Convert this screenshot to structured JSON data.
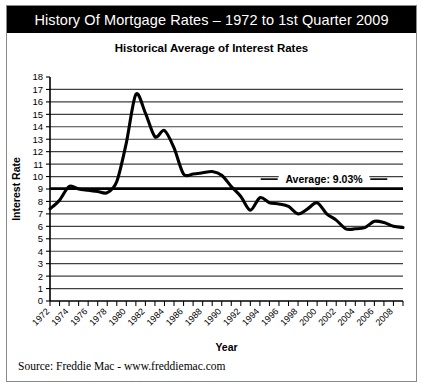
{
  "banner": {
    "title": "History Of Mortgage Rates – 1972 to 1st Quarter 2009"
  },
  "chart_title": "Historical Average of Interest Rates",
  "footer": {
    "source": "Source:  Freddie Mac - www.freddiemac.com"
  },
  "colors": {
    "banner_bg": "#000000",
    "banner_text": "#ffffff",
    "line": "#000000",
    "grid": "#404040",
    "frame": "#8a8a8a",
    "background": "#ffffff"
  },
  "chart_data": {
    "type": "line",
    "title": "Historical Average of Interest Rates",
    "xlabel": "Year",
    "ylabel": "Interest Rate",
    "xlim": [
      1972,
      2009
    ],
    "ylim": [
      0,
      18
    ],
    "ytick_step": 1,
    "xtick_step": 1,
    "xtick_label_step": 2,
    "grid": true,
    "legend": "none",
    "ytick_labels": [
      "0",
      "1",
      "2",
      "3",
      "4",
      "5",
      "6",
      "7",
      "8",
      "9",
      "10",
      "11",
      "12",
      "13",
      "14",
      "15",
      "16",
      "17",
      "18"
    ],
    "xtick_labels": [
      "1972",
      "1974",
      "1976",
      "1978",
      "1980",
      "1982",
      "1984",
      "1986",
      "1988",
      "1990",
      "1992",
      "1994",
      "1996",
      "1998",
      "2000",
      "2002",
      "2004",
      "2006",
      "2008"
    ],
    "series": [
      {
        "name": "Average Interest Rate",
        "x": [
          1972,
          1973,
          1974,
          1975,
          1976,
          1977,
          1978,
          1979,
          1980,
          1981,
          1982,
          1983,
          1984,
          1985,
          1986,
          1987,
          1988,
          1989,
          1990,
          1991,
          1992,
          1993,
          1994,
          1995,
          1996,
          1997,
          1998,
          1999,
          2000,
          2001,
          2002,
          2003,
          2004,
          2005,
          2006,
          2007,
          2008,
          2009
        ],
        "values": [
          7.4,
          8.1,
          9.2,
          9.0,
          8.9,
          8.8,
          8.7,
          9.6,
          12.7,
          16.6,
          15.1,
          13.2,
          13.7,
          12.3,
          10.2,
          10.2,
          10.3,
          10.4,
          10.1,
          9.2,
          8.4,
          7.3,
          8.3,
          7.9,
          7.8,
          7.6,
          7.0,
          7.4,
          7.9,
          7.0,
          6.5,
          5.8,
          5.8,
          5.9,
          6.4,
          6.3,
          6.0,
          5.9
        ]
      }
    ],
    "annotations": [
      {
        "name": "average-line",
        "label": "Average: 9.03%",
        "value": 9.03,
        "type": "horizontal-line"
      }
    ]
  }
}
